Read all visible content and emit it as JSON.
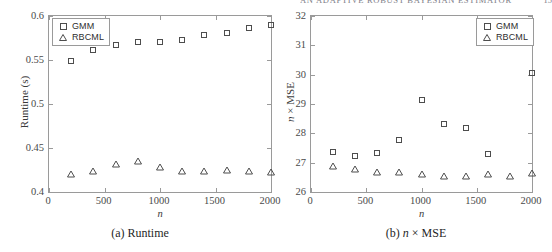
{
  "running_head": {
    "text": "AN ADAPTIVE ROBUST BAYESIAN ESTIMATOR",
    "page_number": "15"
  },
  "figures": [
    {
      "caption": "(a) Runtime",
      "caption_prefix": "(a)",
      "caption_body": "Runtime",
      "legend": [
        {
          "label": "GMM",
          "marker": "square"
        },
        {
          "label": "RBCML",
          "marker": "triangle"
        }
      ],
      "chart_data": {
        "type": "scatter",
        "title": "(a) Runtime",
        "xlabel": "n",
        "ylabel": "Runtime (s)",
        "xlim": [
          0,
          2000
        ],
        "ylim": [
          0.4,
          0.6
        ],
        "xticks": [
          0,
          500,
          1000,
          1500,
          2000
        ],
        "xticklabels": [
          "0",
          "500",
          "1000",
          "1500",
          "2000"
        ],
        "yticks": [
          0.4,
          0.45,
          0.5,
          0.55,
          0.6
        ],
        "yticklabels": [
          "0.4",
          "0.45",
          "0.5",
          "0.55",
          "0.6"
        ],
        "grid": false,
        "legend_position": "upper left",
        "x": [
          200,
          400,
          600,
          800,
          1000,
          1200,
          1400,
          1600,
          1800,
          2000
        ],
        "series": [
          {
            "name": "GMM",
            "marker": "square",
            "values": [
              0.549,
              0.561,
              0.567,
              0.57,
              0.571,
              0.573,
              0.578,
              0.581,
              0.586,
              0.59
            ]
          },
          {
            "name": "RBCML",
            "marker": "triangle",
            "values": [
              0.421,
              0.424,
              0.432,
              0.435,
              0.428,
              0.424,
              0.424,
              0.425,
              0.424,
              0.423
            ]
          }
        ]
      }
    },
    {
      "caption": "(b) n × MSE",
      "caption_prefix": "(b)",
      "caption_body": "× MSE",
      "caption_ital": "n",
      "legend": [
        {
          "label": "GMM",
          "marker": "square"
        },
        {
          "label": "RBCML",
          "marker": "triangle"
        }
      ],
      "chart_data": {
        "type": "scatter",
        "title": "(b) n × MSE",
        "xlabel": "n",
        "ylabel": "n × MSE",
        "xlim": [
          0,
          2000
        ],
        "ylim": [
          26,
          32
        ],
        "xticks": [
          0,
          500,
          1000,
          1500,
          2000
        ],
        "xticklabels": [
          "0",
          "500",
          "1000",
          "1500",
          "2000"
        ],
        "yticks": [
          26,
          27,
          28,
          29,
          30,
          31,
          32
        ],
        "yticklabels": [
          "26",
          "27",
          "28",
          "29",
          "30",
          "31",
          "32"
        ],
        "grid": false,
        "legend_position": "upper right",
        "x": [
          200,
          400,
          600,
          800,
          1000,
          1200,
          1400,
          1600,
          1800,
          2000
        ],
        "series": [
          {
            "name": "GMM",
            "marker": "square",
            "values": [
              27.38,
              27.22,
              27.32,
              27.77,
              29.12,
              28.33,
              28.17,
              27.31,
              null,
              30.05
            ]
          },
          {
            "name": "RBCML",
            "marker": "triangle",
            "values": [
              26.89,
              26.78,
              26.68,
              26.67,
              26.61,
              26.55,
              26.56,
              26.61,
              26.55,
              26.66
            ]
          }
        ]
      }
    }
  ]
}
